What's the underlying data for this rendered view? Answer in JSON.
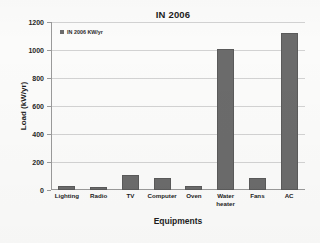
{
  "chart_data": {
    "type": "bar",
    "title": "IN 2006",
    "xlabel": "Equipments",
    "ylabel": "Load (kW/yr)",
    "categories": [
      "Lighting",
      "Radio",
      "TV",
      "Computer",
      "Oven",
      "Water\nheater",
      "Fans",
      "AC"
    ],
    "values": [
      30,
      20,
      110,
      88,
      28,
      1010,
      85,
      1120
    ],
    "ylim": [
      0,
      1200
    ],
    "yticks": [
      0,
      200,
      400,
      600,
      800,
      1000,
      1200
    ],
    "ytick_labels": [
      "0",
      "200",
      "400",
      "600",
      "800",
      "1000",
      "1200"
    ],
    "grid": true,
    "legend": {
      "position": "top-left-inside",
      "entries": [
        {
          "label": "IN 2006 KW/yr",
          "color": "#6b6b6b"
        }
      ]
    },
    "series": [
      {
        "name": "IN 2006 KW/yr",
        "color": "#6b6b6b",
        "values": [
          30,
          20,
          110,
          88,
          28,
          1010,
          85,
          1120
        ]
      }
    ]
  },
  "colors": {
    "bar": "#6b6b6b",
    "bar_border": "#5a5a5a",
    "axis": "#9a9a9a",
    "grid": "#d2d2d2",
    "text": "#1d1d1d",
    "background": "#fbfbfa"
  }
}
